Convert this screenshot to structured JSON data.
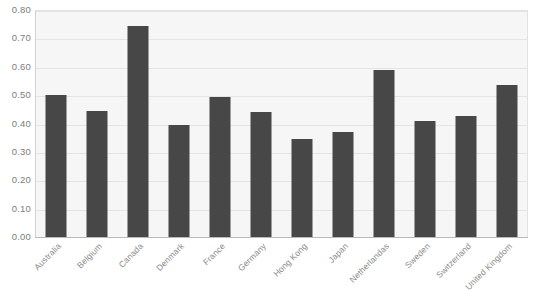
{
  "chart_data": {
    "type": "bar",
    "title": "",
    "subtitle": "",
    "xlabel": "",
    "ylabel": "",
    "ylim": [
      0.0,
      0.8
    ],
    "ytick_step": 0.1,
    "grid": true,
    "legend": false,
    "legend_position": "none",
    "orientation": "vertical",
    "bar_color": "#474747",
    "plot_background": "#f6f6f6",
    "gridline_color": "#e4e4e4",
    "axis_color": "#b9b9b9",
    "tick_label_color": "#7d7d7d",
    "category_label_color": "#8a8a8a",
    "category_label_rotation": -45,
    "ytick_labels": [
      "0.80",
      "0.70",
      "0.60",
      "0.50",
      "0.40",
      "0.30",
      "0.20",
      "0.10",
      "0.00"
    ],
    "ytick_values": [
      0.8,
      0.7,
      0.6,
      0.5,
      0.4,
      0.3,
      0.2,
      0.1,
      0.0
    ],
    "categories": [
      "Australia",
      "Belgium",
      "Canada",
      "Denmark",
      "France",
      "Germany",
      "Hong Kong",
      "Japan",
      "Netherlandas",
      "Sweden",
      "Switzerland",
      "United Kingdom"
    ],
    "values": [
      0.5,
      0.445,
      0.745,
      0.395,
      0.495,
      0.44,
      0.345,
      0.37,
      0.59,
      0.41,
      0.425,
      0.535
    ]
  }
}
